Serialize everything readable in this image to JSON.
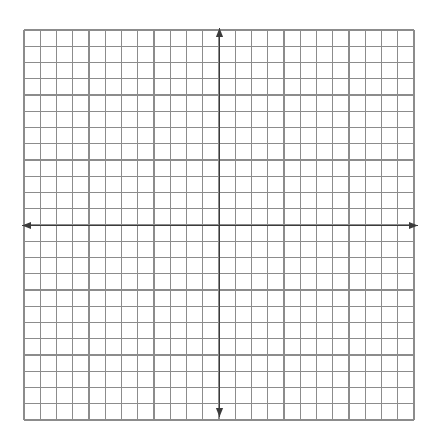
{
  "page": {
    "background_color": "#ffffff",
    "width": 433,
    "height": 437
  },
  "chart_data": {
    "type": "scatter",
    "title": "",
    "subtitle": "",
    "xlabel": "",
    "ylabel": "",
    "series": [],
    "x": [],
    "values": [],
    "categories": [],
    "annotations": [],
    "legend": {
      "visible": false,
      "position": "none",
      "entries": []
    },
    "grid": {
      "visible": true,
      "color": "#8c8c8c",
      "line_width": 1.1,
      "cell_size_px": 16.25,
      "columns": 24,
      "rows": 24,
      "left_px": 24,
      "top_px": 30,
      "right_px": 414,
      "bottom_px": 420,
      "minor_ticks": false
    },
    "axes": {
      "color": "#3b3b3b",
      "line_width": 1.7,
      "origin_px": {
        "x": 219.5,
        "y": 225.5
      },
      "xlim": [
        -12,
        12
      ],
      "ylim": [
        -12,
        12
      ],
      "xticks": [],
      "yticks": [],
      "xtick_labels": [],
      "ytick_labels": [],
      "tick_labels_visible": false,
      "arrowheads": {
        "left": true,
        "right": true,
        "up": true,
        "down": true
      },
      "x_axis_start_px": 22,
      "x_axis_end_px": 418,
      "y_axis_start_px": 28,
      "y_axis_end_px": 417
    }
  },
  "labels": {
    "graph_region": "coordinate-grid",
    "x_axis_name": "x-axis",
    "y_axis_name": "y-axis"
  }
}
